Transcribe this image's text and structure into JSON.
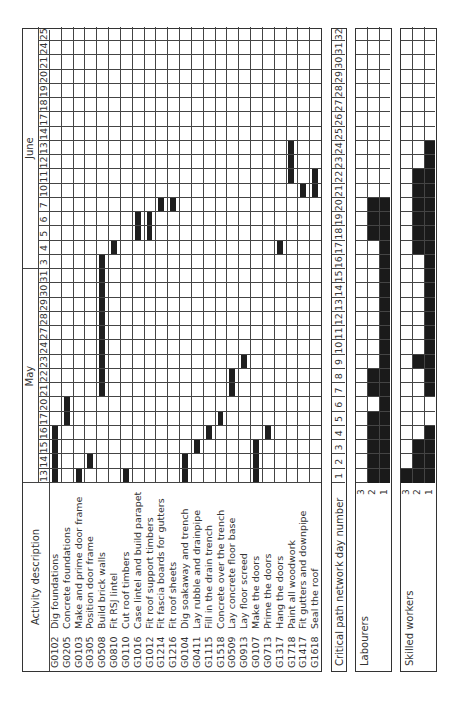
{
  "chart_data": {
    "type": "gantt",
    "title": "",
    "orientation": "rotated 90° counter-clockwise",
    "months": [
      {
        "label": "May",
        "start_col": 0,
        "end_col": 14
      },
      {
        "label": "June",
        "start_col": 15,
        "end_col": 31
      }
    ],
    "dates": [
      "13",
      "14",
      "15",
      "16",
      "17",
      "20",
      "21",
      "22",
      "23",
      "24",
      "27",
      "28",
      "29",
      "30",
      "31",
      "3",
      "4",
      "5",
      "6",
      "7",
      "10",
      "11",
      "12",
      "13",
      "14",
      "17",
      "18",
      "19",
      "20",
      "21",
      "24",
      "25"
    ],
    "activity_header": "Activity description",
    "activities": [
      {
        "code": "G0102",
        "name": "Dig foundations",
        "days": [
          1,
          4
        ]
      },
      {
        "code": "G0205",
        "name": "Concrete foundations",
        "days": [
          5,
          6
        ]
      },
      {
        "code": "G0103",
        "name": "Make and prime door frame",
        "days": [
          1,
          1
        ]
      },
      {
        "code": "G0305",
        "name": "Position door frame",
        "days": [
          2,
          2
        ]
      },
      {
        "code": "G0508",
        "name": "Build brick walls",
        "days": [
          7,
          16
        ]
      },
      {
        "code": "G0810",
        "name": "Fit RSJ lintel",
        "days": [
          17,
          17
        ]
      },
      {
        "code": "G0110",
        "name": "Cut roof timbers",
        "days": [
          1,
          1
        ]
      },
      {
        "code": "G1016",
        "name": "Case  lintel and build parapet",
        "days": [
          18,
          19
        ]
      },
      {
        "code": "G1012",
        "name": "Fit roof support timbers",
        "days": [
          18,
          19
        ]
      },
      {
        "code": "G1214",
        "name": "Fit fascia boards for gutters",
        "days": [
          20,
          20
        ]
      },
      {
        "code": "G1216",
        "name": "Fit roof sheets",
        "days": [
          20,
          20
        ]
      },
      {
        "code": "G0104",
        "name": "Dig soakaway and trench",
        "days": [
          1,
          2
        ]
      },
      {
        "code": "G0411",
        "name": "Lay rubble and drainpipe",
        "days": [
          3,
          3
        ]
      },
      {
        "code": "G1115",
        "name": "Fill in the drain trench",
        "days": [
          4,
          4
        ]
      },
      {
        "code": "G1518",
        "name": "Concrete over the trench",
        "days": [
          5,
          5
        ]
      },
      {
        "code": "G0509",
        "name": "Lay concrete floor base",
        "days": [
          7,
          8
        ]
      },
      {
        "code": "G0913",
        "name": "Lay floor screed",
        "days": [
          9,
          9
        ]
      },
      {
        "code": "G0107",
        "name": "Make the doors",
        "days": [
          1,
          3
        ]
      },
      {
        "code": "G0713",
        "name": "Prime the doors",
        "days": [
          4,
          4
        ]
      },
      {
        "code": "G1317",
        "name": "Hang the doors",
        "days": [
          17,
          17
        ]
      },
      {
        "code": "G1718",
        "name": "Paint all woodwork",
        "days": [
          22,
          24
        ]
      },
      {
        "code": "G1417",
        "name": "Fit gutters and downpipe",
        "days": [
          21,
          21
        ]
      },
      {
        "code": "G1618",
        "name": "Seal the roof",
        "days": [
          21,
          22
        ]
      }
    ],
    "critical_path": {
      "label": "Critical path network day number",
      "days": [
        "1",
        "2",
        "3",
        "4",
        "5",
        "6",
        "7",
        "8",
        "9",
        "10",
        "11",
        "12",
        "13",
        "14",
        "15",
        "16",
        "17",
        "18",
        "19",
        "20",
        "21",
        "22",
        "23",
        "24",
        "25",
        "26",
        "27",
        "28",
        "29",
        "30",
        "31",
        "32"
      ]
    },
    "histograms": [
      {
        "label": "Labourers",
        "levels": [
          "3",
          "2",
          "1"
        ],
        "values": [
          2,
          2,
          2,
          2,
          2,
          1,
          2,
          2,
          1,
          1,
          1,
          1,
          1,
          1,
          1,
          1,
          1,
          2,
          2,
          2,
          0,
          0,
          0,
          0,
          0,
          0,
          0,
          0,
          0,
          0,
          0,
          0
        ]
      },
      {
        "label": "Skilled workers",
        "levels": [
          "3",
          "2",
          "1"
        ],
        "values": [
          3,
          2,
          2,
          1,
          0,
          0,
          1,
          1,
          2,
          1,
          1,
          1,
          1,
          1,
          1,
          1,
          2,
          2,
          2,
          2,
          2,
          2,
          1,
          1,
          0,
          0,
          0,
          0,
          0,
          0,
          0,
          0
        ]
      }
    ],
    "xlabel": "Working day",
    "ylabel": "Activity"
  },
  "colors": {
    "bar": "#1e1e1e",
    "grid": "#444444",
    "background": "#ffffff"
  }
}
